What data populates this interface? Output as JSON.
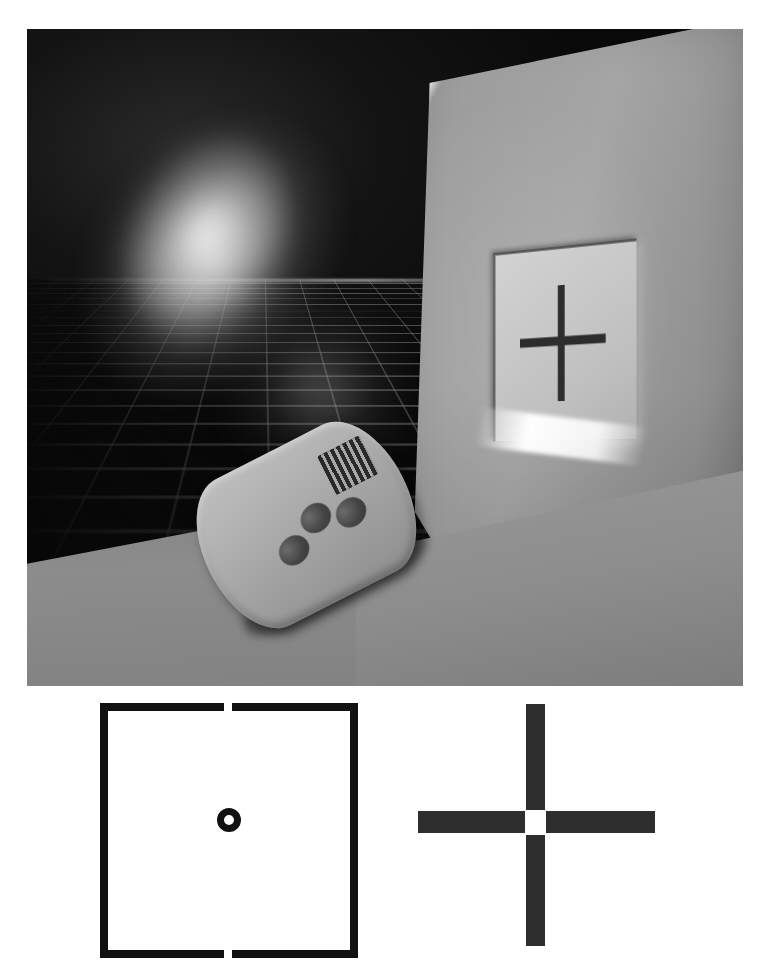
{
  "figure": {
    "type": "composite-illustration",
    "background_color": "#ffffff",
    "palette": {
      "photo_dark_background": "#0c0c0c",
      "wall_panel": "#9a9a9a",
      "screen_face": "#c9c9c9",
      "crosshair": "#2d2d2d",
      "remote_body": "#b2b2b2",
      "diagram_ink": "#111111",
      "diagram_cross_ink": "#2e2e2e"
    }
  },
  "photo": {
    "name": "rendered-scene",
    "caption": "",
    "elements": {
      "beam": {
        "label": "emitted-light-beam",
        "direction": "upper-left to lower-right"
      },
      "grid": {
        "label": "perspective-reference-grid",
        "orientation": "floor-plane"
      },
      "wall": {
        "label": "angled-wall-panel"
      },
      "screen": {
        "label": "illuminated-target-screen"
      },
      "crosshair": {
        "label": "crosshair-marker",
        "symbol": "+"
      },
      "remote": {
        "label": "handheld-remote-control",
        "grille": "speaker-grille",
        "buttons": [
          "button-1",
          "button-2",
          "button-3"
        ]
      },
      "floor": {
        "label": "floor-plane"
      }
    }
  },
  "diagrams": {
    "left": {
      "name": "square-aperture-diagram",
      "shape": "square-outline",
      "gaps": [
        "top-center",
        "bottom-center"
      ],
      "center_feature": "ring",
      "stroke_px": 8,
      "size_px": [
        258,
        255
      ],
      "gap_width_px": 8,
      "ring_outer_px": 24,
      "ring_inner_px": 10
    },
    "right": {
      "name": "cross-target-diagram",
      "shape": "plus-cross",
      "center_feature": "white-square-gap",
      "bar_thickness_px": [
        19,
        22
      ],
      "size_px": [
        237,
        242
      ],
      "center_gap_px": 21
    }
  }
}
